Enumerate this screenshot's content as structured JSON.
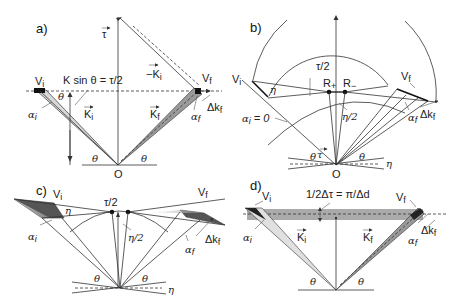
{
  "panels": {
    "a": {
      "label": "a)",
      "tau": "τ",
      "neg_ki": "−K",
      "neg_ki_sub": "i",
      "vi": "V",
      "vi_sub": "i",
      "vf": "V",
      "vf_sub": "f",
      "equation": "K sin θ = τ/2",
      "theta": "θ",
      "alpha_i": "α",
      "alpha_i_sub": "i",
      "ki": "K",
      "ki_sub": "i",
      "kf": "K",
      "kf_sub": "f",
      "alpha_f": "α",
      "alpha_f_sub": "f",
      "delta_kf": "Δk",
      "delta_kf_sub": "f",
      "origin": "O"
    },
    "b": {
      "label": "b)",
      "vi": "V",
      "vi_sub": "i",
      "vf": "V",
      "vf_sub": "f",
      "tau_half": "τ/2",
      "r_plus": "R",
      "r_plus_sub": "+",
      "r_minus": "R",
      "r_minus_sub": "−",
      "eta": "η",
      "eta_half": "η/2",
      "alpha_i_zero": "α",
      "alpha_i_zero_sub": "i",
      "alpha_i_zero_rest": " = 0",
      "alpha_f": "α",
      "alpha_f_sub": "f",
      "delta_kf": "Δk",
      "delta_kf_sub": "f",
      "theta": "θ",
      "tau": "τ",
      "origin": "O"
    },
    "c": {
      "label": "c)",
      "vi": "V",
      "vi_sub": "i",
      "vf": "V",
      "vf_sub": "f",
      "tau_half": "τ/2",
      "eta": "η",
      "eta_half": "η/2",
      "alpha_i": "α",
      "alpha_i_sub": "i",
      "alpha_f": "α",
      "alpha_f_sub": "f",
      "delta_kf": "Δk",
      "delta_kf_sub": "f",
      "theta": "θ"
    },
    "d": {
      "label": "d)",
      "vi": "V",
      "vi_sub": "i",
      "vf": "V",
      "vf_sub": "f",
      "equation": "1/2Δτ = π/Δd",
      "alpha_i": "α",
      "alpha_i_sub": "i",
      "ki": "K",
      "ki_sub": "i",
      "kf": "K",
      "kf_sub": "f",
      "alpha_f": "α",
      "alpha_f_sub": "f",
      "delta_kf": "Δk",
      "delta_kf_sub": "f",
      "theta": "θ"
    }
  }
}
